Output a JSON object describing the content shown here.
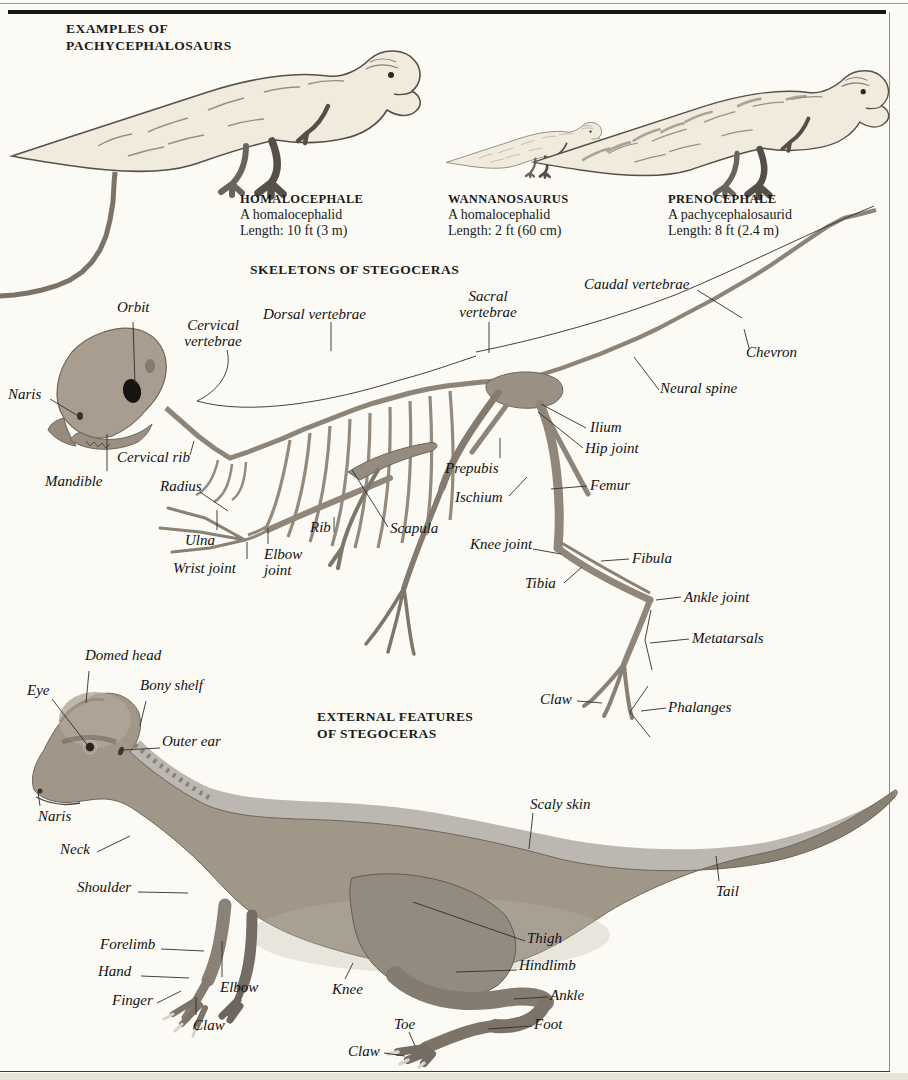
{
  "page": {
    "background": "#fbfaf4",
    "rule_color": "#161616",
    "bone_color": "#8e8478",
    "hide_color": "#a09789"
  },
  "examples": {
    "heading": "EXAMPLES OF\nPACHYCEPHALOSAURS",
    "items": [
      {
        "name": "HOMALOCEPHALE",
        "description": "A homalocephalid",
        "length": "Length: 10 ft (3 m)"
      },
      {
        "name": "WANNANOSAURUS",
        "description": "A homalocephalid",
        "length": "Length: 2 ft (60 cm)"
      },
      {
        "name": "PRENOCEPHALE",
        "description": "A pachycephalosaurid",
        "length": "Length: 8 ft (2.4 m)"
      }
    ]
  },
  "skeleton": {
    "heading": "SKELETONS OF STEGOCERAS",
    "labels": {
      "orbit": "Orbit",
      "cervical_vertebrae": "Cervical vertebrae",
      "dorsal_vertebrae": "Dorsal vertebrae",
      "sacral_vertebrae": "Sacral vertebrae",
      "caudal_vertebrae": "Caudal vertebrae",
      "chevron": "Chevron",
      "neural_spine": "Neural spine",
      "naris": "Naris",
      "mandible": "Mandible",
      "cervical_rib": "Cervical rib",
      "radius": "Radius",
      "ulna": "Ulna",
      "wrist_joint": "Wrist joint",
      "elbow_joint": "Elbow joint",
      "rib": "Rib",
      "scapula": "Scapula",
      "prepubis": "Prepubis",
      "ischium": "Ischium",
      "ilium": "Ilium",
      "hip_joint": "Hip joint",
      "femur": "Femur",
      "knee_joint": "Knee joint",
      "fibula": "Fibula",
      "tibia": "Tibia",
      "ankle_joint": "Ankle joint",
      "metatarsals": "Metatarsals",
      "claw": "Claw",
      "phalanges": "Phalanges"
    }
  },
  "external": {
    "heading": "EXTERNAL FEATURES\nOF STEGOCERAS",
    "labels": {
      "domed_head": "Domed head",
      "eye": "Eye",
      "bony_shelf": "Bony shelf",
      "outer_ear": "Outer ear",
      "naris": "Naris",
      "neck": "Neck",
      "shoulder": "Shoulder",
      "scaly_skin": "Scaly skin",
      "tail": "Tail",
      "forelimb": "Forelimb",
      "thigh": "Thigh",
      "hand": "Hand",
      "hindlimb": "Hindlimb",
      "elbow": "Elbow",
      "finger": "Finger",
      "claw_forelimb": "Claw",
      "knee": "Knee",
      "ankle": "Ankle",
      "toe": "Toe",
      "foot": "Foot",
      "claw_hindlimb": "Claw"
    }
  }
}
